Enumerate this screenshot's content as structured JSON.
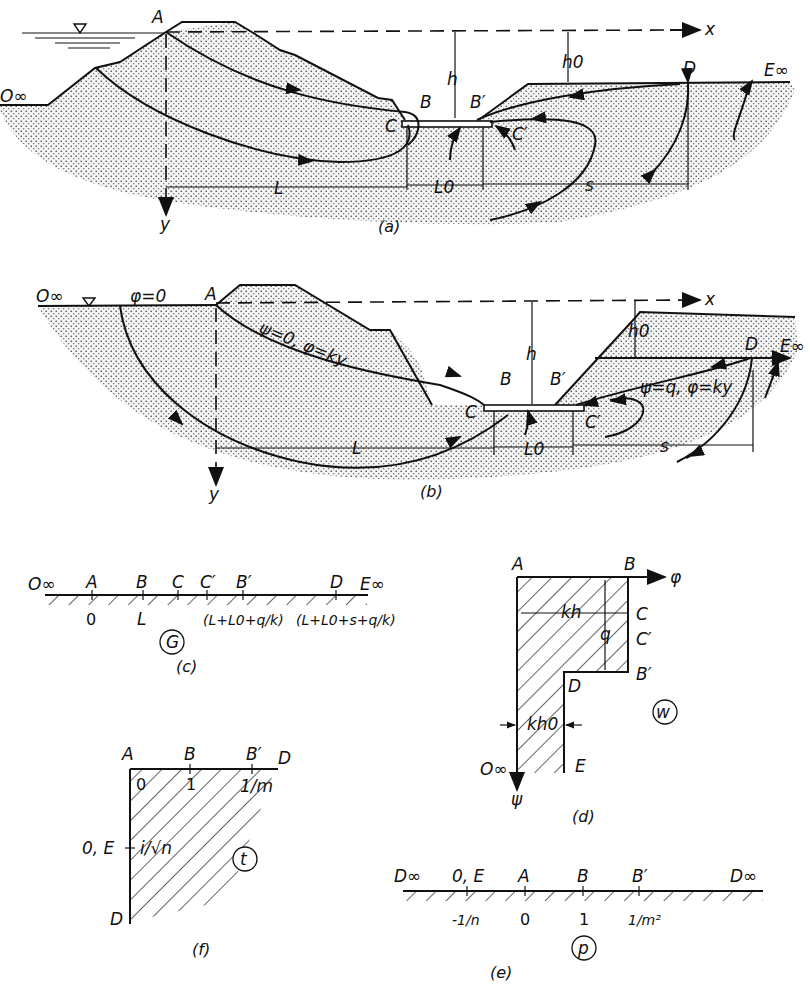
{
  "figure_a": {
    "caption": "(a)",
    "labels": {
      "O": "O∞",
      "A": "A",
      "B": "B",
      "Bp": "B′",
      "C": "C",
      "Cp": "C′",
      "D": "D",
      "E": "E∞",
      "x": "x",
      "y": "y",
      "h": "h",
      "h0": "h0",
      "L": "L",
      "L0": "L0",
      "s": "s"
    }
  },
  "figure_b": {
    "caption": "(b)",
    "labels": {
      "O": "O∞",
      "phi0": "φ=0",
      "A": "A",
      "B": "B",
      "Bp": "B′",
      "C": "C",
      "Cp": "C′",
      "D": "D",
      "E": "E∞",
      "x": "x",
      "y": "y",
      "h": "h",
      "h0": "h0",
      "L": "L",
      "L0": "L0",
      "s": "s",
      "psi0": "ψ=0,  φ=ky",
      "psiq": "ψ=q,  φ=ky"
    }
  },
  "figure_c": {
    "caption": "(c)",
    "plane": "G",
    "points": [
      "O∞",
      "A",
      "B",
      "C",
      "C′",
      "B′",
      "D",
      "E∞"
    ],
    "values": {
      "A": "0",
      "B": "L",
      "Bp": "(L+L0+q/k)",
      "D": "(L+L0+s+q/k)"
    }
  },
  "figure_d": {
    "caption": "(d)",
    "plane": "w",
    "labels": {
      "A": "A",
      "B": "B",
      "C": "C",
      "Cp": "C′",
      "Bp": "B′",
      "D": "D",
      "E": "E",
      "O": "O∞",
      "phi": "φ",
      "psi": "ψ",
      "kh": "kh",
      "q": "q",
      "kh0": "kh0"
    }
  },
  "figure_e": {
    "caption": "(e)",
    "plane": "p",
    "points": [
      "D∞",
      "0, E",
      "A",
      "B",
      "B′",
      "D∞"
    ],
    "values": [
      "-1/n",
      "0",
      "1",
      "1/m²"
    ]
  },
  "figure_f": {
    "caption": "(f)",
    "plane": "t",
    "labels": {
      "A": "A",
      "B": "B",
      "Bp": "B′",
      "D_top": "D",
      "D_bot": "D",
      "OE": "0, E",
      "zero": "0",
      "one": "1",
      "onem": "1/m",
      "isqrtn": "i/√n"
    }
  }
}
